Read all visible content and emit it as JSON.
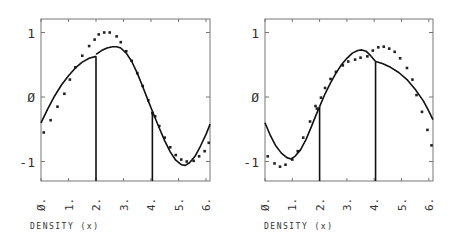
{
  "chart_data": [
    {
      "type": "scatter",
      "panel": "left",
      "title": "",
      "xlabel": "DENSITY (x)",
      "ylabel": "",
      "xlim": [
        0,
        6.15
      ],
      "ylim": [
        -1.3,
        1.22
      ],
      "x_ticks": [
        "Ø.",
        "1.",
        "2.",
        "3.",
        "4.",
        "5.",
        "6."
      ],
      "y_ticks": [
        "1",
        "Ø",
        "-1"
      ],
      "vertical_lines_x": [
        2.0,
        4.05
      ],
      "series": [
        {
          "name": "dots",
          "style": "points",
          "x": [
            0.1,
            0.35,
            0.6,
            0.85,
            1.05,
            1.25,
            1.5,
            1.75,
            1.95,
            2.1,
            2.3,
            2.5,
            2.75,
            2.9,
            3.1,
            3.3,
            3.5,
            3.7,
            3.9,
            4.05,
            4.15,
            4.3,
            4.5,
            4.7,
            4.9,
            5.1,
            5.3,
            5.55,
            5.75,
            5.95,
            6.1
          ],
          "y": [
            -0.55,
            -0.36,
            -0.15,
            0.05,
            0.27,
            0.46,
            0.64,
            0.79,
            0.89,
            0.97,
            1.0,
            1.0,
            0.94,
            0.85,
            0.71,
            0.56,
            0.37,
            0.17,
            -0.05,
            -0.25,
            -0.3,
            -0.45,
            -0.63,
            -0.78,
            -0.9,
            -0.97,
            -1.0,
            -0.99,
            -0.92,
            -0.84,
            -0.71
          ]
        },
        {
          "name": "fit-segment-1",
          "style": "line",
          "x": [
            0,
            0.25,
            0.5,
            0.75,
            1.0,
            1.25,
            1.5,
            1.75,
            2.0
          ],
          "y": [
            -0.4,
            -0.18,
            0.02,
            0.19,
            0.33,
            0.45,
            0.54,
            0.6,
            0.63
          ]
        },
        {
          "name": "fit-segment-2",
          "style": "line",
          "x": [
            2.0,
            2.2,
            2.4,
            2.6,
            2.75,
            2.9,
            3.1,
            3.3,
            3.5,
            3.7,
            3.9,
            4.05
          ],
          "y": [
            0.66,
            0.72,
            0.76,
            0.78,
            0.78,
            0.76,
            0.68,
            0.55,
            0.37,
            0.16,
            -0.06,
            -0.22
          ]
        },
        {
          "name": "fit-segment-3",
          "style": "line",
          "x": [
            4.05,
            4.3,
            4.5,
            4.7,
            4.9,
            5.1,
            5.25,
            5.4,
            5.6,
            5.8,
            6.0,
            6.15
          ],
          "y": [
            -0.22,
            -0.48,
            -0.68,
            -0.85,
            -0.98,
            -1.05,
            -1.06,
            -1.02,
            -0.92,
            -0.76,
            -0.58,
            -0.42
          ]
        }
      ]
    },
    {
      "type": "scatter",
      "panel": "right",
      "title": "",
      "xlabel": "DENSITY (x)",
      "ylabel": "",
      "xlim": [
        0,
        6.15
      ],
      "ylim": [
        -1.3,
        1.22
      ],
      "x_ticks": [
        "Ø.",
        "1.",
        "2.",
        "3.",
        "4.",
        "5.",
        "6."
      ],
      "y_ticks": [
        "1",
        "Ø",
        "-1"
      ],
      "vertical_lines_x": [
        2.0,
        4.05
      ],
      "series": [
        {
          "name": "dots",
          "style": "points",
          "x": [
            0.1,
            0.35,
            0.55,
            0.75,
            1.0,
            1.2,
            1.4,
            1.65,
            1.85,
            1.9,
            2.05,
            2.2,
            2.4,
            2.6,
            2.85,
            3.05,
            3.3,
            3.5,
            3.75,
            3.95,
            4.15,
            4.35,
            4.55,
            4.75,
            4.95,
            5.2,
            5.4,
            5.55,
            5.75,
            5.95,
            6.1
          ],
          "y": [
            -0.92,
            -1.03,
            -1.08,
            -1.05,
            -0.97,
            -0.84,
            -0.63,
            -0.38,
            -0.14,
            -0.18,
            -0.01,
            0.14,
            0.28,
            0.39,
            0.49,
            0.55,
            0.58,
            0.61,
            0.63,
            0.72,
            0.77,
            0.78,
            0.75,
            0.7,
            0.6,
            0.45,
            0.27,
            0.03,
            -0.23,
            -0.51,
            -0.75
          ]
        },
        {
          "name": "fit-segment-1",
          "style": "line",
          "x": [
            0,
            0.2,
            0.4,
            0.6,
            0.8,
            0.95,
            1.1,
            1.3,
            1.5,
            1.7,
            1.85,
            2.0
          ],
          "y": [
            -0.4,
            -0.6,
            -0.76,
            -0.87,
            -0.94,
            -0.96,
            -0.92,
            -0.82,
            -0.66,
            -0.46,
            -0.3,
            -0.15
          ]
        },
        {
          "name": "fit-segment-2",
          "style": "line",
          "x": [
            2.0,
            2.2,
            2.4,
            2.6,
            2.8,
            3.0,
            3.2,
            3.4,
            3.55,
            3.7,
            3.85,
            4.05
          ],
          "y": [
            -0.15,
            0.05,
            0.22,
            0.37,
            0.5,
            0.6,
            0.68,
            0.72,
            0.73,
            0.71,
            0.65,
            0.55
          ]
        },
        {
          "name": "fit-segment-3",
          "style": "line",
          "x": [
            4.05,
            4.3,
            4.6,
            4.9,
            5.2,
            5.5,
            5.8,
            6.0,
            6.15
          ],
          "y": [
            0.55,
            0.52,
            0.46,
            0.38,
            0.27,
            0.12,
            -0.06,
            -0.22,
            -0.35
          ]
        }
      ]
    }
  ],
  "panels": [
    {
      "xlabel": "DENSITY  (x)",
      "y_ticks": [
        "1",
        "Ø",
        "-1"
      ],
      "x_ticks": [
        "Ø.",
        "1.",
        "2.",
        "3.",
        "4.",
        "5.",
        "6."
      ]
    },
    {
      "xlabel": "DENSITY  (x)",
      "y_ticks": [
        "1",
        "Ø",
        "-1"
      ],
      "x_ticks": [
        "Ø.",
        "1.",
        "2.",
        "3.",
        "4.",
        "5.",
        "6."
      ]
    }
  ]
}
